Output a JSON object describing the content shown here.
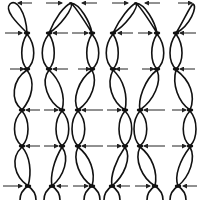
{
  "diagram": {
    "title": "",
    "colors": {
      "line": "#111111",
      "arrow": "#222222",
      "background": "#ffffff"
    },
    "rows": [
      {
        "id": "row-top",
        "y": 33,
        "nodes": [
          27,
          49,
          92,
          113,
          157,
          176
        ],
        "arrows_right": [
          [
            5,
            22
          ],
          [
            72,
            88
          ],
          [
            138,
            152
          ]
        ],
        "arrows_left": [
          [
            68,
            53
          ],
          [
            133,
            118
          ],
          [
            196,
            180
          ]
        ]
      },
      {
        "id": "row-2",
        "y": 69,
        "nodes": [
          27,
          49,
          92,
          113,
          157,
          176
        ],
        "arrows_right": [
          [
            10,
            24
          ],
          [
            78,
            90
          ],
          [
            142,
            154
          ]
        ],
        "arrows_left": [
          [
            68,
            53
          ],
          [
            128,
            116
          ],
          [
            195,
            180
          ]
        ]
      },
      {
        "id": "row-3",
        "y": 110,
        "nodes": [
          22,
          62,
          78,
          125,
          140,
          190
        ],
        "arrows_right": [
          [
            44,
            58
          ],
          [
            107,
            121
          ],
          [
            172,
            186
          ]
        ],
        "arrows_left": [
          [
            40,
            26
          ],
          [
            103,
            82
          ],
          [
            165,
            144
          ]
        ]
      },
      {
        "id": "row-4",
        "y": 146,
        "nodes": [
          22,
          62,
          78,
          125,
          140,
          190
        ],
        "arrows_right": [
          [
            44,
            58
          ],
          [
            107,
            121
          ],
          [
            172,
            186
          ]
        ],
        "arrows_left": [
          [
            40,
            26
          ],
          [
            103,
            82
          ],
          [
            165,
            144
          ]
        ]
      },
      {
        "id": "row-bottom",
        "y": 186,
        "nodes": [
          28,
          52,
          92,
          112,
          155,
          178
        ],
        "arrows_right": [
          [
            3,
            22
          ],
          [
            73,
            88
          ],
          [
            135,
            150
          ]
        ],
        "arrows_left": [
          [
            68,
            57
          ],
          [
            130,
            117
          ],
          [
            197,
            183
          ]
        ]
      }
    ],
    "top_arrows": {
      "y": 3,
      "right": [
        [
          46,
          62
        ],
        [
          112,
          128
        ],
        [
          178,
          192
        ]
      ],
      "left": [
        [
          32,
          18
        ],
        [
          97,
          82
        ],
        [
          160,
          145
        ]
      ]
    }
  }
}
